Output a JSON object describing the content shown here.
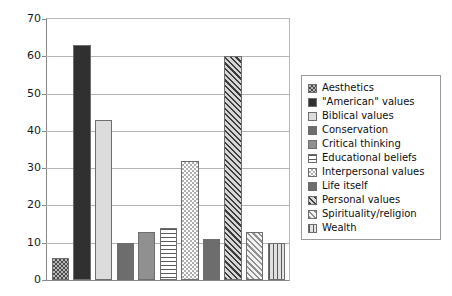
{
  "chart_data": {
    "type": "bar",
    "title": "",
    "xlabel": "",
    "ylabel": "",
    "ylim": [
      0,
      70
    ],
    "ytick_step": 10,
    "yticks": [
      "70",
      "60",
      "50",
      "40",
      "30",
      "20",
      "10",
      "0"
    ],
    "grid": true,
    "legend_position": "right",
    "categories": [
      "Aesthetics",
      "\"American\" values",
      "Biblical values",
      "Conservation",
      "Critical thinking",
      "Educational beliefs",
      "Interpersonal values",
      "Life itself",
      "Personal values",
      "Spirituality/religion",
      "Wealth"
    ],
    "values": [
      6,
      63,
      43,
      10,
      13,
      14,
      32,
      11,
      60,
      13,
      10
    ],
    "series": [
      {
        "name": "Count",
        "values": [
          6,
          63,
          43,
          10,
          13,
          14,
          32,
          11,
          60,
          13,
          10
        ]
      }
    ],
    "bar_patterns": [
      "check-dark",
      "solid-dark",
      "solid-light",
      "solid-mid",
      "solid-midlite",
      "hstripe",
      "check-light",
      "solid-mid",
      "diag-dark",
      "diag-light",
      "vstripe"
    ],
    "colors": {
      "solid_dark": "#303030",
      "solid_mid": "#6d6d6d",
      "solid_midlite": "#909090",
      "solid_light": "#dcdcdc",
      "grid": "#b4b4b4",
      "axis": "#8a8a8a",
      "background": "#ffffff",
      "text": "#0f0f0f"
    }
  },
  "legend": {
    "items": [
      {
        "label": "Aesthetics",
        "pattern": "check-dark"
      },
      {
        "label": "\"American\" values",
        "pattern": "solid-dark"
      },
      {
        "label": "Biblical values",
        "pattern": "solid-light"
      },
      {
        "label": "Conservation",
        "pattern": "solid-mid"
      },
      {
        "label": "Critical thinking",
        "pattern": "solid-midlite"
      },
      {
        "label": "Educational beliefs",
        "pattern": "hstripe"
      },
      {
        "label": "Interpersonal values",
        "pattern": "check-light"
      },
      {
        "label": "Life itself",
        "pattern": "solid-mid"
      },
      {
        "label": "Personal values",
        "pattern": "diag-dark"
      },
      {
        "label": "Spirituality/religion",
        "pattern": "diag-light"
      },
      {
        "label": "Wealth",
        "pattern": "vstripe"
      }
    ]
  }
}
